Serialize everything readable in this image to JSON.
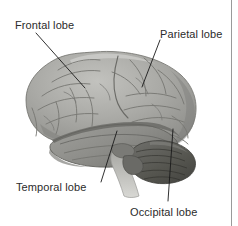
{
  "figure": {
    "type": "anatomical-illustration",
    "background_color": "#ffffff",
    "border_color": "#9a9a9a",
    "label_text_color": "#2b2b2b",
    "leader_line_color": "#1a1a1a"
  },
  "labels": {
    "frontal": "Frontal lobe",
    "parietal": "Parietal lobe",
    "temporal": "Temporal lobe",
    "occipital": "Occipital lobe"
  },
  "regions": {
    "cerebrum_fill": "#a8a8a4",
    "cerebrum_shadow": "#8e8e8a",
    "temporal_fill": "#8f8f8b",
    "cerebellum_fill": "#5d5d59",
    "brainstem_fill": "#b9b9b4",
    "sulci_stroke": "#7b7b77",
    "outline_stroke": "#6e6e6a"
  }
}
